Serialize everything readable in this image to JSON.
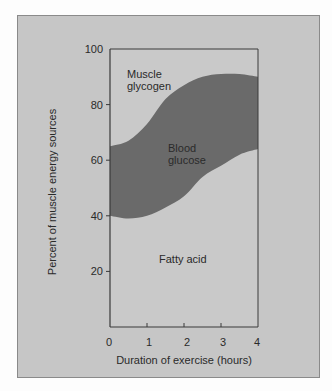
{
  "chart_data": {
    "type": "area",
    "title": "",
    "xlabel": "Duration of exercise (hours)",
    "ylabel": "Percent of muscle energy sources",
    "xlim": [
      0,
      4
    ],
    "ylim": [
      0,
      100
    ],
    "x_ticks": [
      "0",
      "1",
      "2",
      "3",
      "4"
    ],
    "y_ticks": [
      "20",
      "40",
      "60",
      "80",
      "100"
    ],
    "grid": false,
    "legend": "none (inline region labels)",
    "x": [
      0,
      0.5,
      1,
      1.5,
      2,
      2.5,
      3,
      3.5,
      4
    ],
    "series": [
      {
        "name": "Fatty acid",
        "stack": "bottom",
        "upper_boundary": [
          40,
          39,
          40,
          43,
          47,
          54,
          58,
          62,
          64
        ]
      },
      {
        "name": "Blood glucose",
        "stack": "middle",
        "upper_boundary": [
          65,
          67,
          73,
          82,
          87,
          90,
          91,
          91,
          90
        ]
      },
      {
        "name": "Muscle glycogen",
        "stack": "top",
        "upper_boundary": [
          100,
          100,
          100,
          100,
          100,
          100,
          100,
          100,
          100
        ]
      }
    ],
    "region_labels": {
      "muscle_glycogen": [
        "Muscle",
        "glycogen"
      ],
      "blood_glucose": [
        "Blood",
        "glucose"
      ],
      "fatty_acid": "Fatty acid"
    },
    "colors": {
      "panel_bg": "#c6c6c6",
      "light_region": "#c9c9c9",
      "dark_region": "#6a6a6a",
      "axis": "#3a3a3a"
    }
  }
}
